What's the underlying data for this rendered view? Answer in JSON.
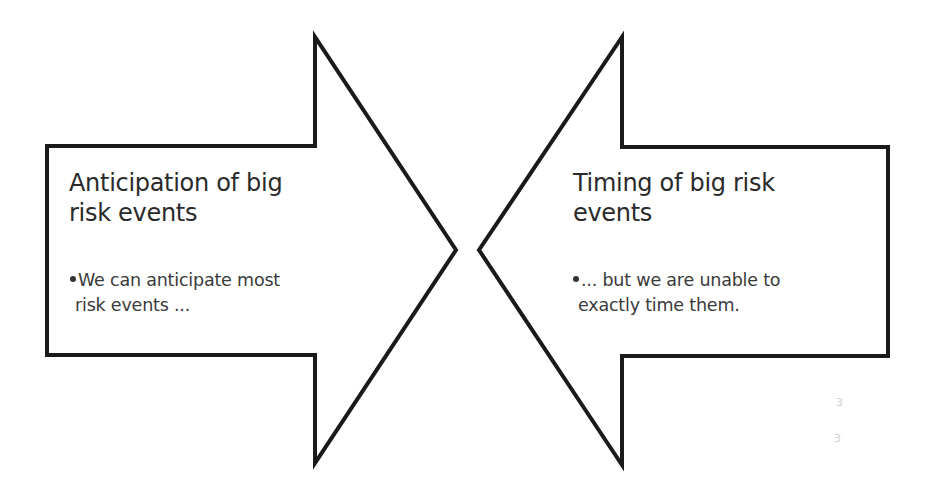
{
  "diagram": {
    "stroke_color": "#1a1a1a",
    "fill_color": "#ffffff",
    "left_arrow": {
      "direction": "right",
      "title_lines": [
        "Anticipation of big",
        "risk events"
      ],
      "bullet_lines": [
        "We can anticipate most",
        "risk events ..."
      ]
    },
    "right_arrow": {
      "direction": "left",
      "title_lines": [
        "Timing of big risk",
        "events"
      ],
      "bullet_lines": [
        "... but we are unable to",
        "exactly time them."
      ]
    },
    "faint_marks": [
      "3",
      "3"
    ]
  }
}
